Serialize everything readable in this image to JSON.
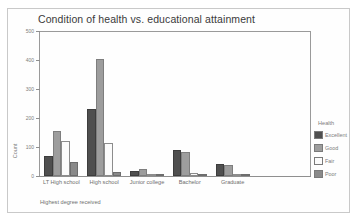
{
  "chart_data": {
    "type": "bar",
    "title": "Condition of health vs. educational attainment",
    "xlabel": "Highest degree received",
    "ylabel": "Count",
    "ylim": [
      0,
      500
    ],
    "yticks": [
      "0",
      "100",
      "200",
      "300",
      "400",
      "500"
    ],
    "grid": false,
    "legend_position": "right",
    "legend_title": "Health",
    "categories": [
      "LT High school",
      "High school",
      "Junior college",
      "Bachelor",
      "Graduate"
    ],
    "series": [
      {
        "name": "Excellent",
        "color": "#4f4f4f",
        "values": [
          68,
          230,
          19,
          88,
          40
        ]
      },
      {
        "name": "Good",
        "color": "#9d9d9d",
        "values": [
          155,
          405,
          25,
          82,
          37
        ]
      },
      {
        "name": "Fair",
        "color": "#fbfbfb",
        "values": [
          122,
          115,
          7,
          11,
          4
        ]
      },
      {
        "name": "Poor",
        "color": "#8a8a8a",
        "values": [
          48,
          15,
          2,
          3,
          1
        ]
      }
    ]
  }
}
